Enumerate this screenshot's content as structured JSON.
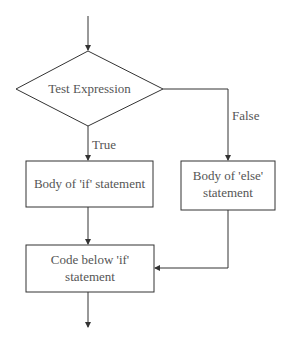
{
  "diagram": {
    "type": "flowchart",
    "nodes": {
      "test": {
        "label": "Test Expression",
        "shape": "diamond"
      },
      "if_body": {
        "label": "Body of 'if' statement",
        "shape": "rectangle"
      },
      "else_body": {
        "label_line1": "Body of 'else'",
        "label_line2": "statement",
        "shape": "rectangle"
      },
      "code_below": {
        "label_line1": "Code below 'if'",
        "label_line2": "statement",
        "shape": "rectangle"
      }
    },
    "edges": {
      "true_label": "True",
      "false_label": "False"
    },
    "colors": {
      "stroke": "#333333",
      "text": "#555555",
      "background": "#ffffff"
    }
  }
}
